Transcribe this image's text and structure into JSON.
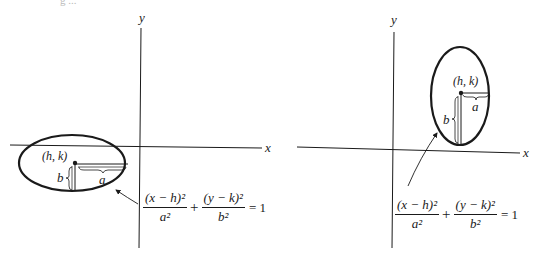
{
  "header_fragment": "g ...",
  "diagrams": [
    {
      "id": "horizontal-ellipse",
      "axes": {
        "x_label": "x",
        "y_label": "y"
      },
      "center_label": "(h, k)",
      "semi_axis_labels": {
        "horizontal": "a",
        "vertical": "b"
      },
      "equation": {
        "term1_num": "(x − h)²",
        "term1_den": "a²",
        "plus": "+",
        "term2_num": "(y − k)²",
        "term2_den": "b²",
        "rhs": "= 1"
      }
    },
    {
      "id": "vertical-ellipse",
      "axes": {
        "x_label": "x",
        "y_label": "y"
      },
      "center_label": "(h, k)",
      "semi_axis_labels": {
        "horizontal": "a",
        "vertical": "b"
      },
      "equation": {
        "term1_num": "(x − h)²",
        "term1_den": "a²",
        "plus": "+",
        "term2_num": "(y − k)²",
        "term2_den": "b²",
        "rhs": "= 1"
      }
    }
  ],
  "colors": {
    "ink": "#1a1a1a",
    "background": "#ffffff"
  }
}
